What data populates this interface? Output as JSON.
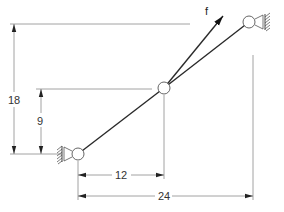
{
  "diagram": {
    "type": "two-bar truss with applied force",
    "force_label": "f",
    "dimensions": {
      "vertical_total": "18",
      "vertical_middle": "9",
      "horizontal_middle": "12",
      "horizontal_total": "24"
    },
    "nodes": [
      {
        "name": "left-support-joint",
        "support": "fixed pin (hatched wall on left)"
      },
      {
        "name": "middle-joint",
        "support": "free"
      },
      {
        "name": "right-support-joint",
        "support": "fixed pin (hatched wall on right)"
      }
    ],
    "colors": {
      "members": "#2a2a2a",
      "dimension_lines": "#8a8a8a",
      "background": "#ffffff"
    }
  }
}
